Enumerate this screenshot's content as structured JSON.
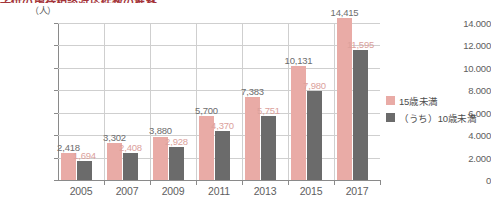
{
  "title": {
    "text": "子供の虐待相談対応件数の推移",
    "color": "#a4343a",
    "clipped": true
  },
  "unit_label": "（人）",
  "legend": {
    "position": "right",
    "items": [
      {
        "label": "15歳未満",
        "color": "#e9aba6"
      },
      {
        "label": "（うち）10歳未満",
        "color": "#6b6b6b"
      }
    ]
  },
  "chart_data": {
    "type": "bar",
    "title": "子供の虐待相談対応件数の推移",
    "xlabel": "",
    "ylabel": "（人）",
    "ylim": [
      0,
      14000
    ],
    "ytick_step": 2000,
    "grid": true,
    "legend_position": "right",
    "categories": [
      "2005",
      "2007",
      "2009",
      "2011",
      "2013",
      "2015",
      "2017"
    ],
    "ytick_labels": [
      "0",
      "2.000",
      "4.000",
      "6.000",
      "8.000",
      "10.000",
      "12.000",
      "14.000"
    ],
    "ytick_values": [
      0,
      2000,
      4000,
      6000,
      8000,
      10000,
      12000,
      14000
    ],
    "series": [
      {
        "name": "15歳未満",
        "color": "#e9aba6",
        "values": [
          2418,
          3302,
          3880,
          5700,
          7383,
          10131,
          14415
        ],
        "labels": [
          "2,418",
          "3,302",
          "3,880",
          "5,700",
          "7,383",
          "10,131",
          "14,415"
        ]
      },
      {
        "name": "（うち）10歳未満",
        "color": "#6b6b6b",
        "values": [
          1694,
          2408,
          2928,
          4370,
          5751,
          7980,
          11595
        ],
        "labels": [
          "1,694",
          "2,408",
          "2,928",
          "4,370",
          "5,751",
          "7,980",
          "11,595"
        ]
      }
    ]
  }
}
